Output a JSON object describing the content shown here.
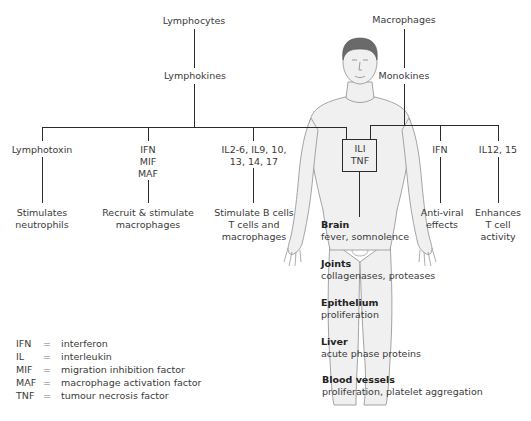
{
  "diagram": {
    "sources": {
      "left": {
        "cell": "Lymphocytes",
        "product": "Lymphokines"
      },
      "right": {
        "cell": "Macrophages",
        "product": "Monokines"
      }
    },
    "branches": [
      {
        "mediators": [
          "Lymphotoxin"
        ],
        "effect": [
          "Stimulates",
          "neutrophils"
        ]
      },
      {
        "mediators": [
          "IFN",
          "MIF",
          "MAF"
        ],
        "effect": [
          "Recruit & stimulate",
          "macrophages"
        ]
      },
      {
        "mediators": [
          "IL2-6, IL9, 10,",
          "13, 14, 17"
        ],
        "effect": [
          "Stimulate B cells",
          "T cells and",
          "macrophages"
        ]
      },
      {
        "mediators": [
          "ILI",
          "TNF"
        ],
        "effect": []
      },
      {
        "mediators": [
          "IFN"
        ],
        "effect": [
          "Anti-viral",
          "effects"
        ]
      },
      {
        "mediators": [
          "IL12, 15"
        ],
        "effect": [
          "Enhances",
          "T cell",
          "activity"
        ]
      }
    ],
    "systemic_effects": [
      {
        "organ": "Brain",
        "effect": "fever, somnolence"
      },
      {
        "organ": "Joints",
        "effect": "collagenases, proteases"
      },
      {
        "organ": "Epithelium",
        "effect": "proliferation"
      },
      {
        "organ": "Liver",
        "effect": "acute phase proteins"
      },
      {
        "organ": "Blood vessels",
        "effect": "proliferation, platelet aggregation"
      }
    ],
    "legend": [
      {
        "abbr": "IFN",
        "eq": "=",
        "meaning": "interferon"
      },
      {
        "abbr": "IL",
        "eq": "=",
        "meaning": "interleukin"
      },
      {
        "abbr": "MIF",
        "eq": "=",
        "meaning": "migration inhibition factor"
      },
      {
        "abbr": "MAF",
        "eq": "=",
        "meaning": "macrophage activation factor"
      },
      {
        "abbr": "TNF",
        "eq": "=",
        "meaning": "tumour necrosis factor"
      }
    ],
    "colors": {
      "line": "#2a2a2a",
      "text": "#3a3a3a",
      "body_fill": "#f0f0f0",
      "body_outline": "#9a9a9a",
      "hair": "#6a6a6a"
    }
  }
}
